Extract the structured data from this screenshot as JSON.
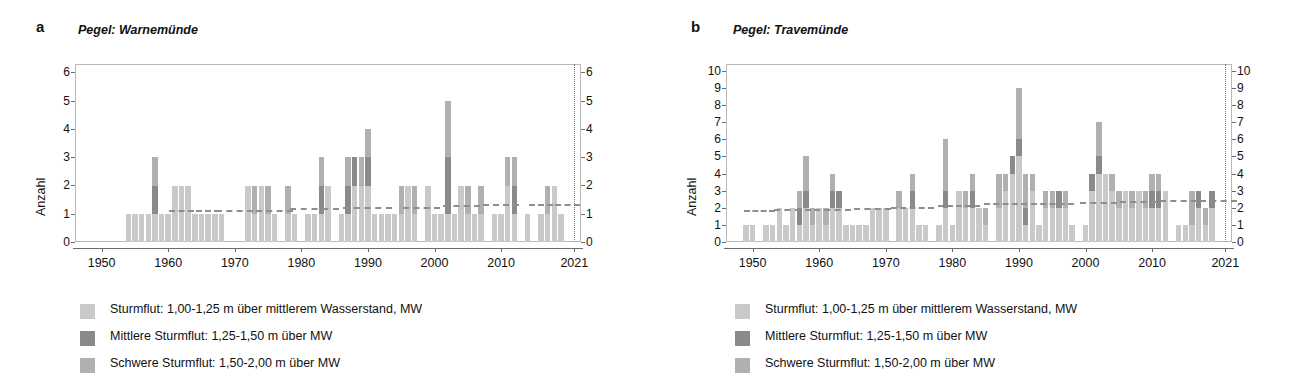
{
  "figure": {
    "panels": [
      {
        "letter": "a",
        "title": "Pegel: Warnemünde",
        "ylabel": "Anzahl",
        "yticks": [
          "0",
          "1",
          "2",
          "3",
          "4",
          "5",
          "6"
        ],
        "xticks": [
          "1950",
          "1960",
          "1970",
          "1980",
          "1990",
          "2000",
          "2010",
          "2021"
        ],
        "legend": [
          {
            "label": "Sturmflut: 1,00-1,25 m über mittlerem Wasserstand, MW",
            "color": "#c9c9c9"
          },
          {
            "label": "Mittlere Sturmflut: 1,25-1,50 m über MW",
            "color": "#8a8a8a"
          },
          {
            "label": "Schwere Sturmflut: 1,50-2,00 m über MW",
            "color": "#b0b0b0"
          }
        ]
      },
      {
        "letter": "b",
        "title": "Pegel: Travemünde",
        "ylabel": "Anzahl",
        "yticks": [
          "0",
          "1",
          "2",
          "3",
          "4",
          "5",
          "6",
          "7",
          "8",
          "9",
          "10"
        ],
        "xticks": [
          "1950",
          "1960",
          "1970",
          "1980",
          "1990",
          "2000",
          "2010",
          "2021"
        ],
        "legend": [
          {
            "label": "Sturmflut: 1,00-1,25 m über mittlerem Wasserstand, MW",
            "color": "#c9c9c9"
          },
          {
            "label": "Mittlere Sturmflut: 1,25-1,50 m über MW",
            "color": "#8a8a8a"
          },
          {
            "label": "Schwere Sturmflut: 1,50-2,00 m über MW",
            "color": "#b0b0b0"
          }
        ]
      }
    ]
  },
  "chart_data": [
    {
      "type": "bar",
      "stacked": true,
      "title": "Pegel: Warnemünde",
      "panel_letter": "a",
      "xlabel": "",
      "ylabel": "Anzahl",
      "xlim": [
        1946,
        2022
      ],
      "ylim": [
        0,
        6.3
      ],
      "grid": false,
      "legend_position": "below",
      "annotations": {
        "vertical_dotted_line_year": 2021,
        "dashed_line": "gleitender Mittelwert / Trend"
      },
      "series": [
        {
          "name": "Sturmflut: 1,00-1,25 m über mittlerem Wasserstand, MW",
          "color": "#c9c9c9"
        },
        {
          "name": "Mittlere Sturmflut: 1,25-1,50 m über MW",
          "color": "#8a8a8a"
        },
        {
          "name": "Schwere Sturmflut: 1,50-2,00 m über MW",
          "color": "#b0b0b0"
        }
      ],
      "years": [
        1954,
        1955,
        1956,
        1957,
        1958,
        1959,
        1960,
        1961,
        1962,
        1963,
        1964,
        1965,
        1966,
        1967,
        1968,
        1972,
        1973,
        1974,
        1975,
        1976,
        1978,
        1979,
        1981,
        1982,
        1983,
        1984,
        1986,
        1987,
        1988,
        1989,
        1990,
        1991,
        1992,
        1993,
        1994,
        1995,
        1996,
        1997,
        1999,
        2000,
        2001,
        2002,
        2003,
        2004,
        2005,
        2006,
        2007,
        2009,
        2010,
        2011,
        2012,
        2014,
        2016,
        2017,
        2018,
        2019
      ],
      "values_light": [
        1,
        1,
        1,
        1,
        1,
        1,
        1,
        2,
        2,
        2,
        1,
        1,
        1,
        1,
        1,
        2,
        1,
        2,
        1,
        1,
        1,
        1,
        1,
        1,
        1,
        2,
        1,
        1,
        2,
        2,
        2,
        1,
        1,
        1,
        1,
        1,
        2,
        1,
        2,
        1,
        1,
        1,
        1,
        2,
        1,
        1,
        1,
        1,
        1,
        2,
        1,
        1,
        1,
        1,
        2,
        1
      ],
      "values_medium": [
        0,
        0,
        0,
        0,
        1,
        0,
        0,
        0,
        0,
        0,
        0,
        0,
        0,
        0,
        0,
        0,
        0,
        0,
        0,
        0,
        0,
        0,
        0,
        0,
        1,
        0,
        0,
        1,
        1,
        0,
        1,
        0,
        0,
        0,
        0,
        0,
        0,
        0,
        0,
        0,
        0,
        2,
        0,
        0,
        0,
        0,
        0,
        0,
        0,
        0,
        1,
        0,
        0,
        0,
        0,
        0
      ],
      "values_dark": [
        0,
        0,
        0,
        0,
        1,
        0,
        0,
        0,
        0,
        0,
        0,
        0,
        0,
        0,
        0,
        0,
        1,
        0,
        1,
        0,
        1,
        0,
        0,
        0,
        1,
        0,
        0,
        1,
        0,
        1,
        1,
        0,
        0,
        0,
        0,
        1,
        0,
        1,
        0,
        0,
        0,
        2,
        0,
        0,
        1,
        0,
        1,
        0,
        0,
        1,
        1,
        0,
        0,
        1,
        0,
        0
      ],
      "totals": [
        1,
        1,
        1,
        1,
        3,
        1,
        1,
        2,
        2,
        2,
        1,
        1,
        1,
        1,
        1,
        2,
        2,
        2,
        2,
        1,
        2,
        1,
        1,
        1,
        3,
        2,
        1,
        3,
        3,
        3,
        4,
        1,
        1,
        1,
        1,
        2,
        2,
        2,
        2,
        1,
        1,
        5,
        1,
        2,
        2,
        1,
        2,
        1,
        1,
        3,
        2,
        1,
        1,
        2,
        2,
        1
      ],
      "trend_points": [
        {
          "year": 1962,
          "value": 1.12
        },
        {
          "year": 1966,
          "value": 1.12
        },
        {
          "year": 1970,
          "value": 1.15
        },
        {
          "year": 1976,
          "value": 1.15
        },
        {
          "year": 1982,
          "value": 1.2
        },
        {
          "year": 1990,
          "value": 1.25
        },
        {
          "year": 1998,
          "value": 1.25
        },
        {
          "year": 2004,
          "value": 1.3
        },
        {
          "year": 2010,
          "value": 1.33
        },
        {
          "year": 2016,
          "value": 1.35
        },
        {
          "year": 2020,
          "value": 1.35
        }
      ]
    },
    {
      "type": "bar",
      "stacked": true,
      "title": "Pegel: Travemünde",
      "panel_letter": "b",
      "xlabel": "",
      "ylabel": "Anzahl",
      "xlim": [
        1946,
        2022
      ],
      "ylim": [
        0,
        10.4
      ],
      "grid": false,
      "legend_position": "below",
      "annotations": {
        "vertical_dotted_line_year": 2021,
        "dashed_line": "gleitender Mittelwert / Trend"
      },
      "series": [
        {
          "name": "Sturmflut: 1,00-1,25 m über mittlerem Wasserstand, MW",
          "color": "#c9c9c9"
        },
        {
          "name": "Mittlere Sturmflut: 1,25-1,50 m über MW",
          "color": "#8a8a8a"
        },
        {
          "name": "Schwere Sturmflut: 1,50-2,00 m über MW",
          "color": "#b0b0b0"
        }
      ],
      "years": [
        1949,
        1950,
        1952,
        1953,
        1954,
        1955,
        1956,
        1957,
        1958,
        1959,
        1960,
        1961,
        1962,
        1963,
        1964,
        1965,
        1966,
        1967,
        1968,
        1969,
        1970,
        1972,
        1973,
        1974,
        1975,
        1976,
        1978,
        1979,
        1980,
        1981,
        1982,
        1983,
        1984,
        1985,
        1987,
        1988,
        1989,
        1990,
        1991,
        1992,
        1993,
        1994,
        1995,
        1996,
        1997,
        1998,
        2000,
        2001,
        2002,
        2003,
        2004,
        2005,
        2006,
        2007,
        2008,
        2009,
        2010,
        2011,
        2012,
        2014,
        2015,
        2016,
        2017,
        2018,
        2019
      ],
      "values_light": [
        1,
        1,
        1,
        1,
        2,
        1,
        2,
        1,
        2,
        1,
        2,
        1,
        2,
        2,
        1,
        1,
        1,
        1,
        2,
        2,
        2,
        2,
        2,
        2,
        1,
        1,
        1,
        2,
        1,
        3,
        2,
        2,
        2,
        1,
        2,
        3,
        4,
        5,
        1,
        3,
        1,
        2,
        2,
        2,
        2,
        1,
        1,
        3,
        4,
        4,
        3,
        2,
        3,
        2,
        3,
        2,
        2,
        2,
        3,
        1,
        1,
        1,
        2,
        1,
        2
      ],
      "values_medium": [
        0,
        0,
        0,
        0,
        0,
        0,
        0,
        1,
        1,
        0,
        0,
        0,
        1,
        1,
        0,
        0,
        0,
        0,
        0,
        0,
        0,
        0,
        0,
        1,
        0,
        0,
        0,
        1,
        0,
        0,
        0,
        1,
        0,
        0,
        0,
        0,
        1,
        1,
        1,
        0,
        0,
        0,
        0,
        1,
        0,
        0,
        0,
        1,
        1,
        0,
        0,
        0,
        0,
        0,
        0,
        0,
        1,
        1,
        0,
        0,
        0,
        0,
        1,
        0,
        1
      ],
      "values_dark": [
        0,
        0,
        0,
        0,
        0,
        0,
        0,
        1,
        2,
        1,
        0,
        1,
        1,
        0,
        0,
        0,
        0,
        0,
        0,
        0,
        0,
        1,
        0,
        1,
        0,
        0,
        0,
        3,
        0,
        0,
        1,
        1,
        0,
        1,
        2,
        1,
        0,
        3,
        2,
        1,
        0,
        1,
        1,
        0,
        1,
        0,
        0,
        0,
        2,
        0,
        1,
        1,
        0,
        1,
        0,
        1,
        1,
        1,
        0,
        0,
        0,
        2,
        0,
        1,
        0
      ],
      "totals": [
        1,
        1,
        1,
        1,
        2,
        1,
        2,
        3,
        5,
        2,
        2,
        2,
        4,
        3,
        1,
        1,
        1,
        1,
        2,
        2,
        2,
        3,
        2,
        4,
        1,
        1,
        1,
        6,
        1,
        3,
        3,
        4,
        2,
        2,
        4,
        4,
        5,
        9,
        4,
        4,
        1,
        3,
        3,
        3,
        3,
        1,
        1,
        4,
        7,
        4,
        4,
        3,
        3,
        3,
        3,
        3,
        4,
        4,
        3,
        1,
        1,
        3,
        3,
        2,
        3
      ],
      "trend_points": [
        {
          "year": 1951,
          "value": 1.85
        },
        {
          "year": 1956,
          "value": 1.9
        },
        {
          "year": 1962,
          "value": 1.95
        },
        {
          "year": 1968,
          "value": 2.0
        },
        {
          "year": 1974,
          "value": 2.05
        },
        {
          "year": 1981,
          "value": 2.15
        },
        {
          "year": 1988,
          "value": 2.25
        },
        {
          "year": 1995,
          "value": 2.3
        },
        {
          "year": 2002,
          "value": 2.35
        },
        {
          "year": 2008,
          "value": 2.4
        },
        {
          "year": 2014,
          "value": 2.45
        },
        {
          "year": 2020,
          "value": 2.45
        }
      ]
    }
  ]
}
